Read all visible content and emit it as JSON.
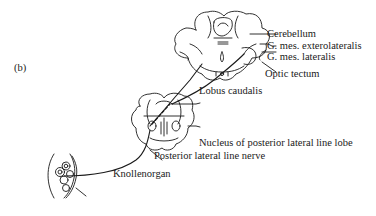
{
  "figure": {
    "panel_label": "(b)",
    "labels": {
      "cerebellum": "Cerebellum",
      "g_mes_exterolateralis": "G. mes. exterolateralis",
      "g_mes_lateralis": "G. mes. lateralis",
      "optic_tectum": "Optic tectum",
      "lobus_caudalis": "Lobus caudalis",
      "nucleus_pll_lobe": "Nucleus of posterior lateral line lobe",
      "posterior_lateral_line_nerve": "Posterior lateral line nerve",
      "knollenorgan": "Knollenorgan"
    },
    "colors": {
      "line": "#1a1a1a",
      "background": "#ffffff"
    }
  }
}
